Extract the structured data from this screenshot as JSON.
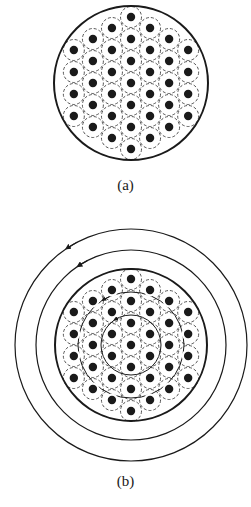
{
  "figure": {
    "panels": [
      {
        "id": "a",
        "label": "(a)",
        "center": [
          131,
          83
        ],
        "boundary_radius": 77,
        "dot_spacing": 22,
        "hex_rings": 3,
        "dot_count": 37,
        "thin_rings": [],
        "outer_current_rings": []
      },
      {
        "id": "b",
        "label": "(b)",
        "center": [
          131,
          345
        ],
        "boundary_radius": 76,
        "dot_spacing": 22,
        "hex_rings": 3,
        "dot_count": 37,
        "thin_rings": [
          30,
          53
        ],
        "outer_current_rings": [
          95,
          116
        ],
        "arrow_direction": "counterclockwise"
      }
    ],
    "colors": {
      "ink": "#1a1a1a",
      "background": "#ffffff"
    }
  }
}
